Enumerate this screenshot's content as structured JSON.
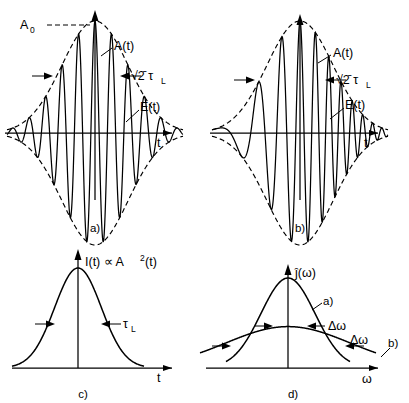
{
  "figure": {
    "panels": [
      {
        "id": "a",
        "caption": "a)",
        "type": "field-envelope",
        "chirped": false,
        "labels": {
          "amplitude": "A",
          "amplitude_sub": "0",
          "envelope": "A(t)",
          "field": "E(t)",
          "width": "√2̄ τ",
          "width_sub": "L",
          "axis_x": "t"
        }
      },
      {
        "id": "b",
        "caption": "b)",
        "type": "field-envelope",
        "chirped": true,
        "labels": {
          "envelope": "A(t)",
          "field": "E(t)",
          "width": "√2̄ τ",
          "width_sub": "L",
          "axis_x": "t"
        }
      },
      {
        "id": "c",
        "caption": "c)",
        "type": "intensity",
        "labels": {
          "axis_y": "I(t) ∝ A",
          "axis_y_sup": "2",
          "axis_y_tail": "(t)",
          "width": "τ",
          "width_sub": "L",
          "axis_x": "t"
        }
      },
      {
        "id": "d",
        "caption": "d)",
        "type": "spectrum",
        "labels": {
          "axis_y": "ĵ(ω)",
          "curve_a": "a)",
          "curve_b": "b)",
          "width_a": "Δω",
          "width_b": "Δω",
          "axis_x": "ω"
        }
      }
    ]
  },
  "chart_data": {
    "type": "line",
    "title": "",
    "panels": [
      {
        "id": "a",
        "name": "Bandwidth-limited pulse: field E(t) and Gaussian envelope A(t)",
        "xlabel": "t",
        "ylabel": "",
        "envelope": {
          "form": "gaussian",
          "peak": 1.0,
          "sigma_px": 33,
          "center_px": 0
        },
        "carrier": {
          "form": "cosine",
          "period_px": 16.5,
          "chirp": 0.0
        },
        "annotations": [
          {
            "label": "A_0",
            "type": "peak-level",
            "value": 1.0
          },
          {
            "label": "sqrt(2) tau_L",
            "type": "fwhm-arrows",
            "value": 1.0
          }
        ]
      },
      {
        "id": "b",
        "name": "Chirped pulse: field E(t) with increasing instantaneous frequency",
        "xlabel": "t",
        "ylabel": "",
        "envelope": {
          "form": "gaussian",
          "peak": 1.0,
          "sigma_px": 33,
          "center_px": 0
        },
        "carrier": {
          "form": "cosine",
          "period_px": 16.5,
          "chirp": 0.55
        },
        "annotations": [
          {
            "label": "sqrt(2) tau_L",
            "type": "fwhm-arrows",
            "value": 1.0
          }
        ]
      },
      {
        "id": "c",
        "name": "Pulse intensity I(t) proportional to A squared of t",
        "xlabel": "t",
        "ylabel": "I(t) ∝ A²(t)",
        "curve": {
          "form": "gaussian",
          "peak": 1.0,
          "sigma_px": 23.3,
          "center_px": 0
        },
        "annotations": [
          {
            "label": "tau_L",
            "type": "fwhm-arrows",
            "value": 0.5
          }
        ]
      },
      {
        "id": "d",
        "name": "Spectral intensity for bandwidth-limited (a) and chirped (b) pulses",
        "xlabel": "ω",
        "ylabel": "ĵ(ω)",
        "series": [
          {
            "name": "a)",
            "form": "gaussian",
            "peak": 1.0,
            "sigma_px": 27,
            "fwhm_label": "Δω"
          },
          {
            "name": "b)",
            "form": "gaussian",
            "peak": 0.46,
            "sigma_px": 62,
            "fwhm_label": "Δω"
          }
        ]
      }
    ]
  }
}
